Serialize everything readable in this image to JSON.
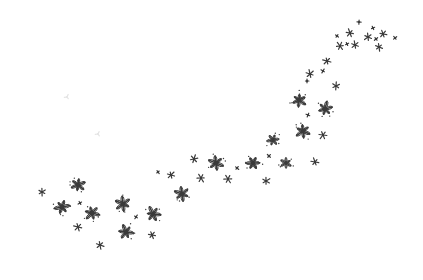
{
  "image": {
    "description": "Scattered hand-drawn ink flower / sparkle marks forming a rising curved trail from lower-left to upper-right on a white background",
    "background_color": "#ffffff",
    "ink_color": "#3a3a3a",
    "faint_color": "#e4e4e4"
  },
  "marks": [
    {
      "kind": "small",
      "cx": 42,
      "cy": 192
    },
    {
      "kind": "large",
      "cx": 78,
      "cy": 185
    },
    {
      "kind": "large",
      "cx": 62,
      "cy": 207
    },
    {
      "kind": "tiny",
      "cx": 80,
      "cy": 203
    },
    {
      "kind": "large",
      "cx": 92,
      "cy": 213
    },
    {
      "kind": "small",
      "cx": 78,
      "cy": 227
    },
    {
      "kind": "small",
      "cx": 100,
      "cy": 245
    },
    {
      "kind": "large",
      "cx": 123,
      "cy": 204
    },
    {
      "kind": "tiny",
      "cx": 136,
      "cy": 217
    },
    {
      "kind": "large",
      "cx": 153,
      "cy": 214
    },
    {
      "kind": "large",
      "cx": 126,
      "cy": 232
    },
    {
      "kind": "small",
      "cx": 152,
      "cy": 235
    },
    {
      "kind": "tiny",
      "cx": 158,
      "cy": 172
    },
    {
      "kind": "small",
      "cx": 171,
      "cy": 175
    },
    {
      "kind": "large",
      "cx": 182,
      "cy": 194
    },
    {
      "kind": "small",
      "cx": 194,
      "cy": 159
    },
    {
      "kind": "large",
      "cx": 216,
      "cy": 163
    },
    {
      "kind": "small",
      "cx": 201,
      "cy": 178
    },
    {
      "kind": "small",
      "cx": 228,
      "cy": 179
    },
    {
      "kind": "tiny",
      "cx": 237,
      "cy": 168
    },
    {
      "kind": "large",
      "cx": 253,
      "cy": 163
    },
    {
      "kind": "tiny",
      "cx": 269,
      "cy": 156
    },
    {
      "kind": "small",
      "cx": 266,
      "cy": 181
    },
    {
      "kind": "medium",
      "cx": 286,
      "cy": 163
    },
    {
      "kind": "small",
      "cx": 315,
      "cy": 162
    },
    {
      "kind": "medium",
      "cx": 273,
      "cy": 140
    },
    {
      "kind": "large",
      "cx": 303,
      "cy": 131
    },
    {
      "kind": "small",
      "cx": 323,
      "cy": 135
    },
    {
      "kind": "tiny",
      "cx": 308,
      "cy": 115
    },
    {
      "kind": "large",
      "cx": 299,
      "cy": 100
    },
    {
      "kind": "large",
      "cx": 325,
      "cy": 109
    },
    {
      "kind": "small",
      "cx": 336,
      "cy": 86
    },
    {
      "kind": "tiny",
      "cx": 307,
      "cy": 81
    },
    {
      "kind": "small",
      "cx": 310,
      "cy": 74
    },
    {
      "kind": "tiny",
      "cx": 323,
      "cy": 71
    },
    {
      "kind": "small",
      "cx": 327,
      "cy": 61
    },
    {
      "kind": "small",
      "cx": 340,
      "cy": 46
    },
    {
      "kind": "tiny",
      "cx": 337,
      "cy": 36
    },
    {
      "kind": "small",
      "cx": 350,
      "cy": 33
    },
    {
      "kind": "tiny",
      "cx": 347,
      "cy": 44
    },
    {
      "kind": "small",
      "cx": 355,
      "cy": 45
    },
    {
      "kind": "tiny",
      "cx": 359,
      "cy": 22
    },
    {
      "kind": "small",
      "cx": 368,
      "cy": 37
    },
    {
      "kind": "tiny",
      "cx": 373,
      "cy": 28
    },
    {
      "kind": "tiny",
      "cx": 376,
      "cy": 39
    },
    {
      "kind": "small",
      "cx": 379,
      "cy": 47
    },
    {
      "kind": "small",
      "cx": 383,
      "cy": 34
    },
    {
      "kind": "tiny",
      "cx": 395,
      "cy": 38
    },
    {
      "kind": "faint",
      "cx": 67,
      "cy": 97
    },
    {
      "kind": "faint",
      "cx": 98,
      "cy": 134
    }
  ]
}
